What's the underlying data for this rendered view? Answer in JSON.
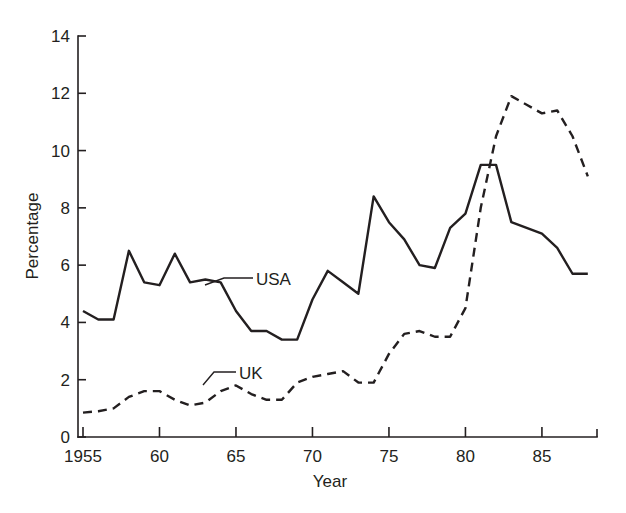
{
  "chart_data": {
    "type": "line",
    "title": "",
    "subtitle": "",
    "xlabel": "Year",
    "ylabel": "Percentage",
    "xlim": [
      1955,
      1988
    ],
    "ylim": [
      0,
      14
    ],
    "grid": false,
    "legend": "inline-annotations",
    "x_ticks": [
      "1955",
      "60",
      "65",
      "70",
      "75",
      "80",
      "85"
    ],
    "x_tick_values": [
      1955,
      1960,
      1965,
      1970,
      1975,
      1980,
      1985
    ],
    "y_ticks": [
      "0",
      "2",
      "4",
      "6",
      "8",
      "10",
      "12",
      "14"
    ],
    "y_tick_values": [
      0,
      2,
      4,
      6,
      8,
      10,
      12,
      14
    ],
    "x": [
      1955,
      1956,
      1957,
      1958,
      1959,
      1960,
      1961,
      1962,
      1963,
      1964,
      1965,
      1966,
      1967,
      1968,
      1969,
      1970,
      1971,
      1972,
      1973,
      1974,
      1975,
      1976,
      1977,
      1978,
      1979,
      1980,
      1981,
      1982,
      1983,
      1984,
      1985,
      1986,
      1987,
      1988
    ],
    "series": [
      {
        "name": "USA",
        "style": "solid",
        "color": "#231f20",
        "label_x": 1967,
        "label_y": 5.6,
        "values": [
          4.4,
          4.1,
          4.1,
          6.5,
          5.4,
          5.3,
          6.4,
          5.4,
          5.5,
          5.4,
          4.4,
          3.7,
          3.7,
          3.4,
          3.4,
          4.8,
          5.8,
          5.4,
          5.0,
          8.4,
          7.5,
          6.9,
          6.0,
          5.9,
          7.3,
          7.8,
          9.5,
          9.5,
          7.5,
          7.3,
          7.1,
          6.6,
          5.7,
          5.7
        ]
      },
      {
        "name": "UK",
        "style": "dashed",
        "color": "#231f20",
        "label_x": 1964,
        "label_y": 2.3,
        "values": [
          0.85,
          0.9,
          1.0,
          1.4,
          1.6,
          1.6,
          1.3,
          1.1,
          1.2,
          1.6,
          1.8,
          1.5,
          1.3,
          1.3,
          1.9,
          2.1,
          2.2,
          2.3,
          1.9,
          1.9,
          2.9,
          3.6,
          3.7,
          3.5,
          3.5,
          4.5,
          8.0,
          10.5,
          11.9,
          11.6,
          11.3,
          11.4,
          10.5,
          9.1
        ]
      }
    ]
  },
  "annotations": {
    "usa_label": "USA",
    "uk_label": "UK"
  },
  "axes": {
    "y_axis_title": "Percentage",
    "x_axis_title": "Year"
  },
  "colors": {
    "ink": "#231f20",
    "background": "#ffffff"
  }
}
